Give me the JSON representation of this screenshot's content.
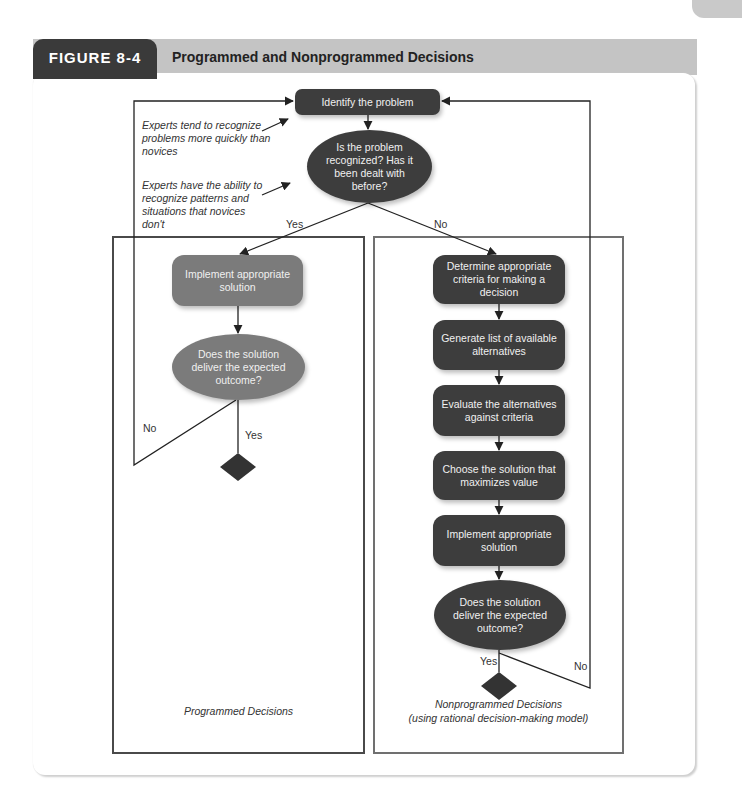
{
  "figure": {
    "number": "FIGURE 8-4",
    "title": "Programmed and Nonprogrammed Decisions"
  },
  "annotations": {
    "experts_recognize": "Experts tend to recognize problems more quickly than novices",
    "experts_patterns": "Experts have the ability to recognize patterns and situations that novices don't"
  },
  "top": {
    "identify": "Identify the problem",
    "question": "Is the problem recognized? Has it been dealt with before?",
    "yes": "Yes",
    "no": "No"
  },
  "programmed": {
    "implement": "Implement appropriate solution",
    "question": "Does the solution deliver the expected outcome?",
    "yes": "Yes",
    "no": "No",
    "label": "Programmed Decisions"
  },
  "nonprogrammed": {
    "steps": [
      "Determine appropriate criteria for making a decision",
      "Generate list of available alternatives",
      "Evaluate the alternatives against criteria",
      "Choose the solution that maximizes value",
      "Implement appropriate solution"
    ],
    "question": "Does the solution deliver the expected outcome?",
    "yes": "Yes",
    "no": "No",
    "label_line1": "Nonprogrammed Decisions",
    "label_line2": "(using rational decision-making model)"
  },
  "colors": {
    "dark_node": "#3d3d3d",
    "light_node": "#7b7b7b",
    "header_tab": "#3a3a3a",
    "header_bar": "#c4c4c4"
  }
}
